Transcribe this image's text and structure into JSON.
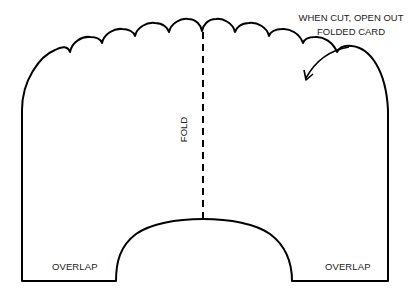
{
  "diagram": {
    "instruction": {
      "line1": "WHEN CUT, OPEN OUT",
      "line2": "FOLDED CARD"
    },
    "fold_label": "FOLD",
    "overlap_left": "OVERLAP",
    "overlap_right": "OVERLAP",
    "colors": {
      "stroke": "#000000",
      "text": "#222222",
      "background": "#ffffff"
    }
  }
}
